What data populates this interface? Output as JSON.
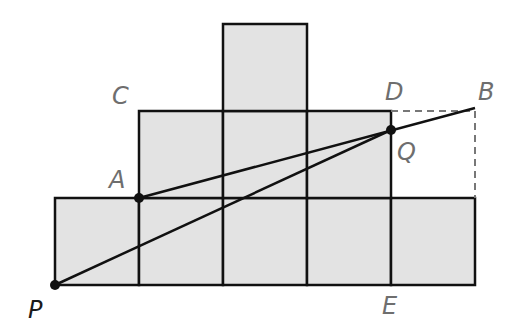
{
  "diagram": {
    "type": "geometry-grid-figure",
    "colors": {
      "square_fill": "#e3e3e3",
      "stroke": "#111111",
      "label": "#6e6e6e",
      "label_p": "#1a1a1a",
      "dashed": "#777777"
    },
    "grid": {
      "unit_px": 84,
      "origin_px": [
        55,
        285
      ],
      "rows": [
        {
          "name": "bottom-row",
          "y_units": 0,
          "x_units_from": 0,
          "x_units_to": 5,
          "squares": 5
        },
        {
          "name": "middle-row",
          "y_units": 1,
          "x_units_from": 1,
          "x_units_to": 4,
          "squares": 3
        },
        {
          "name": "top-row",
          "y_units": 2,
          "x_units_from": 2,
          "x_units_to": 3,
          "squares": 1
        }
      ]
    },
    "points": {
      "P": {
        "label": "P",
        "grid": [
          0,
          0
        ],
        "dot": true
      },
      "A": {
        "label": "A",
        "grid": [
          1,
          1
        ],
        "dot": true
      },
      "Q": {
        "label": "Q",
        "grid": [
          4,
          1.77
        ],
        "dot": true
      },
      "C": {
        "label": "C",
        "grid": [
          1,
          2
        ],
        "dot": false
      },
      "D": {
        "label": "D",
        "grid": [
          4,
          2
        ],
        "dot": false
      },
      "B": {
        "label": "B",
        "grid": [
          5,
          2
        ],
        "dot": false
      },
      "E": {
        "label": "E",
        "grid": [
          4,
          0
        ],
        "dot": false
      }
    },
    "segments": [
      {
        "from": "P",
        "to": "Q",
        "style": "solid"
      },
      {
        "from": "A",
        "to": "B",
        "style": "solid"
      },
      {
        "from": "D",
        "to": "B",
        "style": "dashed"
      },
      {
        "from": "B",
        "to": "bottom-row-top-right",
        "style": "dashed"
      }
    ],
    "labels": {
      "P": "P",
      "A": "A",
      "Q": "Q",
      "C": "C",
      "D": "D",
      "B": "B",
      "E": "E"
    }
  }
}
